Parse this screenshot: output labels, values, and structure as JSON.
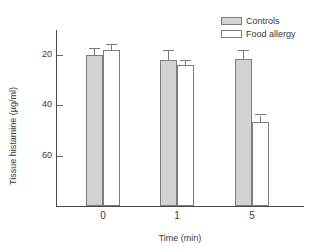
{
  "chart_data": {
    "type": "bar",
    "title": "",
    "xlabel": "Time (min)",
    "ylabel": "Tissue histamine (µg/ml)",
    "categories": [
      "0",
      "1",
      "5"
    ],
    "ylim": [
      0,
      70
    ],
    "yticks": [
      20,
      40,
      60
    ],
    "ytick_labels": [
      "20",
      "40",
      "60"
    ],
    "grid": false,
    "legend_position": "top-right",
    "series": [
      {
        "name": "Controls",
        "color": "#d2d2d2",
        "values": [
          60.0,
          58.0,
          58.5
        ],
        "errors": [
          2.5,
          3.5,
          3.0
        ]
      },
      {
        "name": "Food allergy",
        "color": "#ffffff",
        "values": [
          62.0,
          56.0,
          33.5
        ],
        "errors": [
          2.0,
          1.5,
          2.5
        ]
      }
    ]
  },
  "legend": {
    "entries": [
      {
        "label": "Controls",
        "swatch": "controls-swatch"
      },
      {
        "label": "Food allergy",
        "swatch": "food-allergy-swatch"
      }
    ]
  },
  "axes": {
    "y_tick_0": "60",
    "y_tick_1": "40",
    "y_tick_2": "20",
    "x_cat_0": "0",
    "x_cat_1": "1",
    "x_cat_2": "5"
  }
}
